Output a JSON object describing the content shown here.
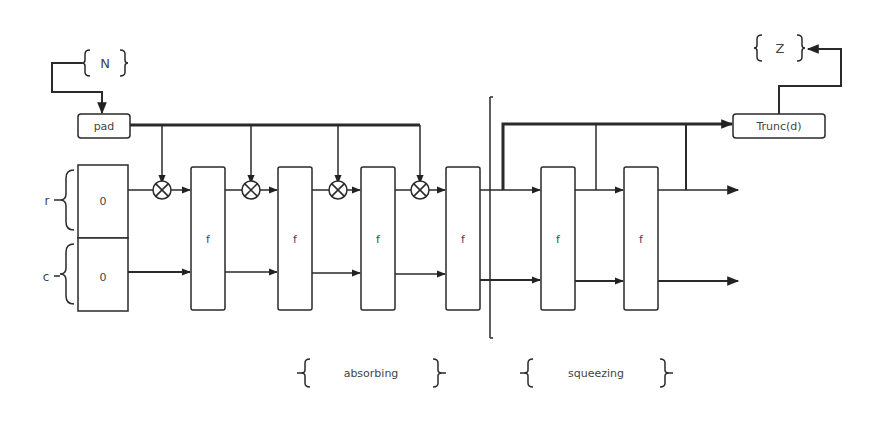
{
  "diagram": {
    "input_label": "N",
    "output_label": "Z",
    "pad_label": "pad",
    "trunc_label": "Trunc(d)",
    "rate_label": "r",
    "capacity_label": "c",
    "state_init": [
      "0",
      "0"
    ],
    "function_label": "f",
    "phases": [
      {
        "name": "absorbing"
      },
      {
        "name": "squeezing"
      }
    ],
    "absorb_blocks": 4,
    "squeeze_blocks": 2,
    "colors": {
      "stroke": "#2a2a2a",
      "text": "#444444",
      "background": "#ffffff"
    }
  }
}
